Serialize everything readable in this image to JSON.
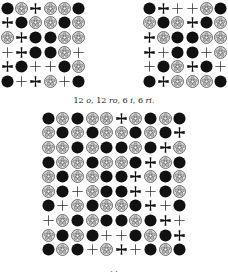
{
  "legend": {
    "o": "black-circle",
    "ro": "rose",
    "i": "cross-pattee",
    "ri": "thin-cross"
  },
  "grids": {
    "left": [
      [
        "o",
        "ro",
        "i",
        "ro",
        "ro",
        "o"
      ],
      [
        "i",
        "o",
        "ro",
        "ro",
        "o",
        "ro"
      ],
      [
        "ro",
        "i",
        "o",
        "o",
        "ro",
        "ro"
      ],
      [
        "ri",
        "i",
        "o",
        "o",
        "ro",
        "ri"
      ],
      [
        "i",
        "o",
        "ri",
        "ri",
        "o",
        "ro"
      ],
      [
        "o",
        "ri",
        "i",
        "ro",
        "ri",
        "o"
      ]
    ],
    "right": [
      [
        "o",
        "i",
        "ri",
        "ri",
        "ro",
        "o"
      ],
      [
        "ro",
        "o",
        "ro",
        "i",
        "o",
        "ro"
      ],
      [
        "i",
        "ro",
        "o",
        "o",
        "ro",
        "ro"
      ],
      [
        "i",
        "ri",
        "o",
        "o",
        "ri",
        "ro"
      ],
      [
        "ri",
        "o",
        "ro",
        "i",
        "o",
        "ri"
      ],
      [
        "o",
        "i",
        "ro",
        "ro",
        "ro",
        "o"
      ]
    ],
    "bottom": [
      [
        "o",
        "ro",
        "o",
        "ro",
        "ro",
        "i",
        "ro",
        "o",
        "ro",
        "o"
      ],
      [
        "ro",
        "o",
        "ro",
        "o",
        "ro",
        "ro",
        "o",
        "ro",
        "o",
        "i"
      ],
      [
        "ro",
        "ro",
        "o",
        "ro",
        "o",
        "o",
        "ro",
        "o",
        "i",
        "ro"
      ],
      [
        "o",
        "ro",
        "ro",
        "o",
        "ro",
        "ro",
        "o",
        "i",
        "ro",
        "o"
      ],
      [
        "ro",
        "o",
        "ro",
        "ro",
        "o",
        "o",
        "i",
        "ro",
        "o",
        "ro"
      ],
      [
        "ro",
        "o",
        "ri",
        "ro",
        "o",
        "o",
        "i",
        "ri",
        "o",
        "ro"
      ],
      [
        "o",
        "ri",
        "ro",
        "o",
        "ro",
        "ro",
        "o",
        "i",
        "ri",
        "o"
      ],
      [
        "ri",
        "ro",
        "o",
        "ro",
        "o",
        "o",
        "ro",
        "o",
        "i",
        "ri"
      ],
      [
        "ro",
        "o",
        "ro",
        "o",
        "ri",
        "ri",
        "o",
        "ro",
        "o",
        "i"
      ],
      [
        "o",
        "ro",
        "o",
        "ri",
        "ro",
        "i",
        "ri",
        "o",
        "ro",
        "o"
      ]
    ]
  },
  "captions": {
    "top": {
      "parts": [
        {
          "text": "12 ",
          "italic": false
        },
        {
          "text": "o",
          "italic": true
        },
        {
          "text": ", 12 ",
          "italic": false
        },
        {
          "text": "ro",
          "italic": true
        },
        {
          "text": ", 6 ",
          "italic": false
        },
        {
          "text": "i",
          "italic": true
        },
        {
          "text": ", 6 ",
          "italic": false
        },
        {
          "text": "ri",
          "italic": true
        },
        {
          "text": ".",
          "italic": false
        }
      ]
    },
    "bottom": {
      "parts": [
        {
          "text": "· ·",
          "italic": false
        }
      ]
    }
  }
}
